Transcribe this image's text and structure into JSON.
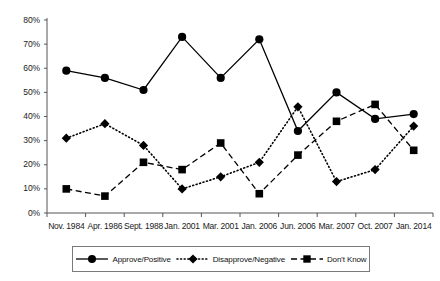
{
  "chart_data": {
    "type": "line",
    "title": "",
    "subtitle": "",
    "xlabel": "",
    "ylabel": "",
    "ylim": [
      0,
      80
    ],
    "ytick_step": 10,
    "grid": false,
    "legend_position": "bottom",
    "categories": [
      "Nov. 1984",
      "Apr. 1986",
      "Sept. 1988",
      "Jan. 2001",
      "Mar. 2001",
      "Jan. 2006",
      "Jun. 2006",
      "Mar. 2007",
      "Oct. 2007",
      "Jan. 2014"
    ],
    "ytick_labels": [
      "0%",
      "10%",
      "20%",
      "30%",
      "40%",
      "50%",
      "60%",
      "70%",
      "80%"
    ],
    "ytick_values": [
      0,
      10,
      20,
      30,
      40,
      50,
      60,
      70,
      80
    ],
    "series": [
      {
        "name": "Approve/Positive",
        "marker": "circle",
        "line_style": "solid",
        "color": "#000000",
        "values": [
          59,
          56,
          51,
          73,
          56,
          72,
          34,
          50,
          39,
          41
        ]
      },
      {
        "name": "Disapprove/Negative",
        "marker": "diamond",
        "line_style": "dotted",
        "color": "#000000",
        "values": [
          31,
          37,
          28,
          10,
          15,
          21,
          44,
          13,
          18,
          36
        ]
      },
      {
        "name": "Don't Know",
        "marker": "square",
        "line_style": "dashed",
        "color": "#000000",
        "values": [
          10,
          7,
          21,
          18,
          29,
          8,
          24,
          38,
          45,
          26
        ]
      }
    ]
  },
  "legend": {
    "items": [
      {
        "label": "Approve/Positive",
        "marker": "circle",
        "line_style": "solid"
      },
      {
        "label": "Disapprove/Negative",
        "marker": "diamond",
        "line_style": "dotted"
      },
      {
        "label": "Don't Know",
        "marker": "square",
        "line_style": "dashed"
      }
    ]
  },
  "colors": {
    "axis": "#555555",
    "series": "#000000",
    "text": "#1a1a1a",
    "legend_border": "#7a7a7a",
    "background": "#ffffff"
  }
}
